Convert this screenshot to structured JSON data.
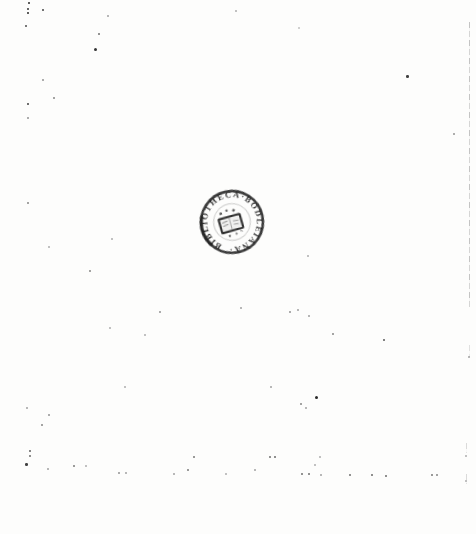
{
  "page": {
    "kind": "scanned blank book page",
    "background_color": "#fdfdfc"
  },
  "stamp": {
    "ring_text": "BIBLIOTHECA·BODLEIANA·",
    "emblem": "open-book",
    "ink_color": "#1b1b1b",
    "shape": "circular seal, tilted counter-clockwise"
  },
  "noise": {
    "speck_color": "#111111",
    "specks": [
      {
        "x": 28,
        "y": 2,
        "s": 1.5,
        "o": 0.8
      },
      {
        "x": 27,
        "y": 8,
        "s": 2,
        "o": 0.85
      },
      {
        "x": 27,
        "y": 12,
        "s": 2,
        "o": 0.9
      },
      {
        "x": 42,
        "y": 9,
        "s": 1.5,
        "o": 0.7
      },
      {
        "x": 107,
        "y": 15,
        "s": 1.5,
        "o": 0.35
      },
      {
        "x": 25,
        "y": 25,
        "s": 2,
        "o": 0.75
      },
      {
        "x": 98,
        "y": 33,
        "s": 2,
        "o": 0.6
      },
      {
        "x": 94,
        "y": 48,
        "s": 3,
        "o": 0.85
      },
      {
        "x": 42,
        "y": 79,
        "s": 1.5,
        "o": 0.4
      },
      {
        "x": 53,
        "y": 97,
        "s": 1.5,
        "o": 0.45
      },
      {
        "x": 27,
        "y": 103,
        "s": 2,
        "o": 0.8
      },
      {
        "x": 27,
        "y": 117,
        "s": 1.5,
        "o": 0.4
      },
      {
        "x": 235,
        "y": 10,
        "s": 1.5,
        "o": 0.3
      },
      {
        "x": 298,
        "y": 27,
        "s": 2,
        "o": 0.25
      },
      {
        "x": 406,
        "y": 75,
        "s": 2.5,
        "o": 0.8
      },
      {
        "x": 453,
        "y": 133,
        "s": 2,
        "o": 0.45
      },
      {
        "x": 27,
        "y": 202,
        "s": 2,
        "o": 0.5
      },
      {
        "x": 111,
        "y": 238,
        "s": 1.5,
        "o": 0.3
      },
      {
        "x": 48,
        "y": 246,
        "s": 1.5,
        "o": 0.3
      },
      {
        "x": 89,
        "y": 270,
        "s": 1.5,
        "o": 0.45
      },
      {
        "x": 159,
        "y": 311,
        "s": 1.5,
        "o": 0.4
      },
      {
        "x": 109,
        "y": 327,
        "s": 1.5,
        "o": 0.3
      },
      {
        "x": 144,
        "y": 334,
        "s": 1.5,
        "o": 0.3
      },
      {
        "x": 240,
        "y": 307,
        "s": 1.5,
        "o": 0.35
      },
      {
        "x": 289,
        "y": 311,
        "s": 1.5,
        "o": 0.4
      },
      {
        "x": 297,
        "y": 309,
        "s": 1.5,
        "o": 0.35
      },
      {
        "x": 308,
        "y": 315,
        "s": 2,
        "o": 0.4
      },
      {
        "x": 332,
        "y": 333,
        "s": 1.5,
        "o": 0.45
      },
      {
        "x": 383,
        "y": 339,
        "s": 2,
        "o": 0.7
      },
      {
        "x": 468,
        "y": 356,
        "s": 1.5,
        "o": 0.35
      },
      {
        "x": 307,
        "y": 255,
        "s": 1.5,
        "o": 0.3
      },
      {
        "x": 270,
        "y": 386,
        "s": 1.5,
        "o": 0.35
      },
      {
        "x": 315,
        "y": 396,
        "s": 3,
        "o": 0.9
      },
      {
        "x": 300,
        "y": 403,
        "s": 2,
        "o": 0.5
      },
      {
        "x": 305,
        "y": 407,
        "s": 1.5,
        "o": 0.35
      },
      {
        "x": 124,
        "y": 386,
        "s": 1.5,
        "o": 0.3
      },
      {
        "x": 26,
        "y": 407,
        "s": 1.5,
        "o": 0.35
      },
      {
        "x": 48,
        "y": 414,
        "s": 1.5,
        "o": 0.4
      },
      {
        "x": 41,
        "y": 424,
        "s": 2,
        "o": 0.5
      },
      {
        "x": 29,
        "y": 450,
        "s": 1.5,
        "o": 0.6
      },
      {
        "x": 29,
        "y": 455,
        "s": 1.5,
        "o": 0.55
      },
      {
        "x": 25,
        "y": 463,
        "s": 2.5,
        "o": 0.8
      },
      {
        "x": 47,
        "y": 468,
        "s": 1.5,
        "o": 0.35
      },
      {
        "x": 73,
        "y": 465,
        "s": 2,
        "o": 0.55
      },
      {
        "x": 85,
        "y": 465,
        "s": 1.5,
        "o": 0.3
      },
      {
        "x": 118,
        "y": 472,
        "s": 1.5,
        "o": 0.4
      },
      {
        "x": 125,
        "y": 472,
        "s": 1.5,
        "o": 0.35
      },
      {
        "x": 173,
        "y": 473,
        "s": 1.5,
        "o": 0.35
      },
      {
        "x": 187,
        "y": 469,
        "s": 2,
        "o": 0.55
      },
      {
        "x": 193,
        "y": 456,
        "s": 1.5,
        "o": 0.5
      },
      {
        "x": 225,
        "y": 473,
        "s": 1.5,
        "o": 0.3
      },
      {
        "x": 269,
        "y": 456,
        "s": 2,
        "o": 0.6
      },
      {
        "x": 274,
        "y": 456,
        "s": 1.5,
        "o": 0.55
      },
      {
        "x": 254,
        "y": 469,
        "s": 1.5,
        "o": 0.35
      },
      {
        "x": 319,
        "y": 456,
        "s": 1.5,
        "o": 0.3
      },
      {
        "x": 314,
        "y": 464,
        "s": 1.5,
        "o": 0.3
      },
      {
        "x": 301,
        "y": 473,
        "s": 2,
        "o": 0.6
      },
      {
        "x": 308,
        "y": 473,
        "s": 2,
        "o": 0.6
      },
      {
        "x": 320,
        "y": 474,
        "s": 1.5,
        "o": 0.35
      },
      {
        "x": 349,
        "y": 474,
        "s": 2,
        "o": 0.6
      },
      {
        "x": 371,
        "y": 474,
        "s": 1.5,
        "o": 0.55
      },
      {
        "x": 385,
        "y": 475,
        "s": 1.5,
        "o": 0.55
      },
      {
        "x": 431,
        "y": 474,
        "s": 1.5,
        "o": 0.5
      },
      {
        "x": 436,
        "y": 474,
        "s": 1.5,
        "o": 0.45
      },
      {
        "x": 465,
        "y": 455,
        "s": 1.5,
        "o": 0.3
      },
      {
        "x": 465,
        "y": 480,
        "s": 1.5,
        "o": 0.3
      }
    ],
    "edge_lines": [
      {
        "x": 469,
        "y": 22,
        "h": 285,
        "o": 0.5
      },
      {
        "x": 469,
        "y": 345,
        "h": 12,
        "o": 0.25
      },
      {
        "x": 466,
        "y": 443,
        "h": 10,
        "o": 0.3
      },
      {
        "x": 466,
        "y": 474,
        "h": 10,
        "o": 0.3
      }
    ]
  }
}
